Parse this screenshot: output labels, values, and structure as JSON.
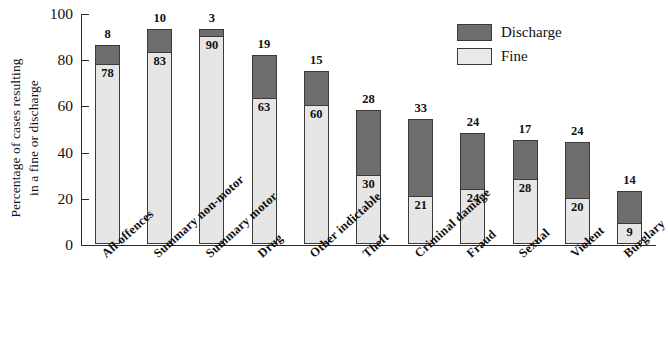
{
  "chart_data": {
    "type": "bar",
    "stacked": true,
    "title": "",
    "xlabel": "",
    "ylabel": "Percentage of cases resulting in a fine or discharge",
    "ylabel_lines": [
      "Percentage of cases resulting",
      "in a fine or discharge"
    ],
    "ylim": [
      0,
      100
    ],
    "yticks": [
      0,
      20,
      40,
      60,
      80,
      100
    ],
    "ytick_labels": [
      "0",
      "20",
      "40",
      "60",
      "80",
      "100"
    ],
    "grid": false,
    "legend_position": "top-right",
    "categories": [
      "All offences",
      "Summary non-motor",
      "Summary motor",
      "Drug",
      "Other indictable",
      "Theft",
      "Criminal damage",
      "Fraud",
      "Sexual",
      "Violent",
      "Burglary"
    ],
    "series": [
      {
        "name": "Fine",
        "color": "#e6e6e6",
        "values": [
          78,
          83,
          90,
          63,
          60,
          30,
          21,
          24,
          28,
          20,
          9
        ]
      },
      {
        "name": "Discharge",
        "color": "#6e6e6e",
        "values": [
          8,
          10,
          3,
          19,
          15,
          28,
          33,
          24,
          17,
          24,
          14
        ]
      }
    ],
    "totals": [
      86,
      93,
      93,
      82,
      75,
      58,
      54,
      48,
      45,
      44,
      23
    ]
  },
  "legend": {
    "items": [
      {
        "label": "Discharge",
        "key": "discharge"
      },
      {
        "label": "Fine",
        "key": "fine"
      }
    ]
  },
  "colors": {
    "discharge": "#6e6e6e",
    "fine": "#e6e6e6",
    "axis": "#2b2b2b",
    "text": "#111111",
    "background": "#ffffff"
  }
}
